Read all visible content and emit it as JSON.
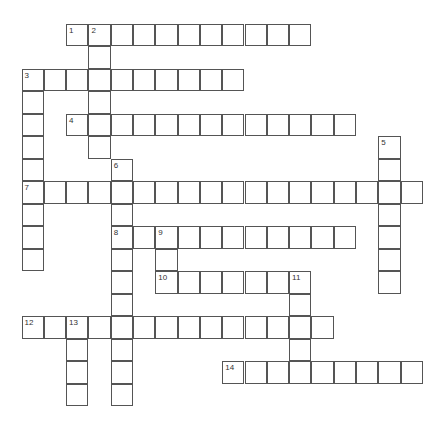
{
  "puzzle": {
    "grid": {
      "origin_x": 22,
      "origin_y": 24,
      "cell_w": 22.3,
      "cell_h": 22.5,
      "border_color": "#555555"
    },
    "entries": [
      {
        "number": 1,
        "direction": "across",
        "row": 0,
        "col": 2,
        "length": 11
      },
      {
        "number": 2,
        "direction": "down",
        "row": 0,
        "col": 3,
        "length": 6
      },
      {
        "number": 3,
        "direction": "across",
        "row": 2,
        "col": 0,
        "length": 10
      },
      {
        "number": 3,
        "direction": "down",
        "row": 2,
        "col": 0,
        "length": 9
      },
      {
        "number": 4,
        "direction": "across",
        "row": 4,
        "col": 2,
        "length": 13
      },
      {
        "number": 5,
        "direction": "down",
        "row": 5,
        "col": 16,
        "length": 7
      },
      {
        "number": 6,
        "direction": "down",
        "row": 6,
        "col": 4,
        "length": 11
      },
      {
        "number": 7,
        "direction": "across",
        "row": 7,
        "col": 0,
        "length": 18
      },
      {
        "number": 8,
        "direction": "across",
        "row": 9,
        "col": 4,
        "length": 11
      },
      {
        "number": 9,
        "direction": "down",
        "row": 9,
        "col": 6,
        "length": 3
      },
      {
        "number": 10,
        "direction": "across",
        "row": 11,
        "col": 6,
        "length": 7
      },
      {
        "number": 11,
        "direction": "down",
        "row": 11,
        "col": 12,
        "length": 5
      },
      {
        "number": 12,
        "direction": "across",
        "row": 13,
        "col": 0,
        "length": 14
      },
      {
        "number": 13,
        "direction": "down",
        "row": 13,
        "col": 2,
        "length": 4
      },
      {
        "number": 14,
        "direction": "across",
        "row": 15,
        "col": 9,
        "length": 9
      }
    ]
  }
}
